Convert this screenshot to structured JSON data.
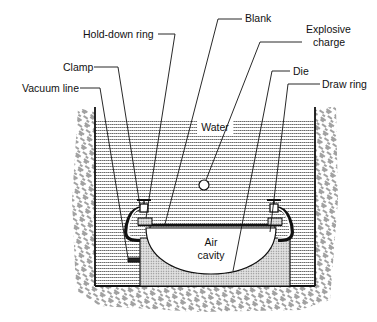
{
  "diagram": {
    "labels": {
      "hold_down_ring": "Hold-down ring",
      "blank": "Blank",
      "explosive_line1": "Explosive",
      "explosive_line2": "charge",
      "clamp": "Clamp",
      "die": "Die",
      "vacuum_line": "Vacuum line",
      "draw_ring": "Draw ring",
      "water": "Water",
      "air_line1": "Air",
      "air_line2": "cavity"
    },
    "colors": {
      "ink": "#111111",
      "water_fill": "#cfcfcf",
      "die_fill": "#bdbdbd",
      "ground_fill": "#9a9a9a",
      "background": "#ffffff"
    }
  }
}
